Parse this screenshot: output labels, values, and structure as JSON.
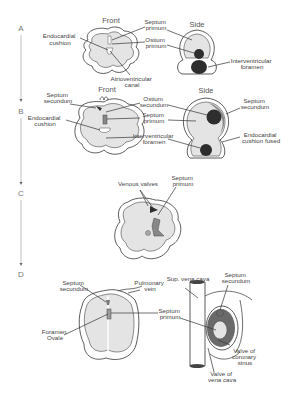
{
  "stages": [
    {
      "id": "A",
      "headers": {
        "front": "Front",
        "side": "Side"
      },
      "labels": {
        "endocardial_cushion": [
          "Endocardial",
          "cushion"
        ],
        "septum_primum": [
          "Septum",
          "primum"
        ],
        "ostium_primum": [
          "Ostium",
          "primum"
        ],
        "atrioventricular_canal": [
          "Atrioventricular",
          "canal"
        ],
        "interventricular_foramen": [
          "Interventricular",
          "foramen"
        ]
      }
    },
    {
      "id": "B",
      "headers": {
        "front": "Front",
        "side": "Side"
      },
      "labels": {
        "septum_secundum_left": [
          "Septum",
          "secundum"
        ],
        "endocardial_cushion": [
          "Endocardial",
          "cushion"
        ],
        "ostium_secundum": [
          "Ostium",
          "secundum"
        ],
        "septum_primum": [
          "Septum",
          "primum"
        ],
        "interventricular_foramen": [
          "Interventricular",
          "foramen"
        ],
        "septum_secundum_right": [
          "Septum",
          "secundum"
        ],
        "endocardial_cushion_fused": [
          "Endocardial",
          "cushion fused"
        ]
      }
    },
    {
      "id": "C",
      "labels": {
        "venous_valves": [
          "Venous valves"
        ],
        "septum_primum": [
          "Septum",
          "primum"
        ]
      }
    },
    {
      "id": "D",
      "labels": {
        "septum_secundum_left": [
          "Septum",
          "secundum"
        ],
        "pulmonary_vein": [
          "Pulmonary",
          "vein"
        ],
        "foramen_ovale": [
          "Foramen",
          "Ovale"
        ],
        "septum_primum": [
          "Septum",
          "primum"
        ],
        "sup_vena_cava": [
          "Sup. vena cava"
        ],
        "septum_secundum_right": [
          "Septum",
          "secundum"
        ],
        "valve_coronary_sinus": [
          "Valve of",
          "coronary",
          "sinus"
        ],
        "valve_vena_cava": [
          "Valve of",
          "vena cava"
        ]
      }
    }
  ]
}
